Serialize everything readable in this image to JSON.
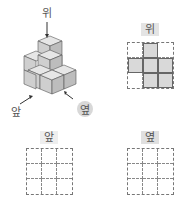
{
  "figure": {
    "labels": {
      "top": "위",
      "front": "앞",
      "side": "옆"
    },
    "colors": {
      "cube_top": "#e6e6e6",
      "cube_left": "#cfcfcf",
      "cube_right": "#bdbdbd",
      "label_bg": "#e4e4e4",
      "filled_cell": "#d9d9d9"
    }
  },
  "views": [
    {
      "name": "top-view",
      "label": "위",
      "rows": 3,
      "cols": 3,
      "filled": [
        [
          0,
          1,
          0
        ],
        [
          1,
          1,
          1
        ],
        [
          0,
          1,
          1
        ]
      ]
    },
    {
      "name": "front-view",
      "label": "앞",
      "rows": 3,
      "cols": 3,
      "filled": [
        [
          0,
          0,
          0
        ],
        [
          0,
          0,
          0
        ],
        [
          0,
          0,
          0
        ]
      ]
    },
    {
      "name": "side-view",
      "label": "옆",
      "rows": 3,
      "cols": 3,
      "filled": [
        [
          0,
          0,
          0
        ],
        [
          0,
          0,
          0
        ],
        [
          0,
          0,
          0
        ]
      ]
    }
  ]
}
